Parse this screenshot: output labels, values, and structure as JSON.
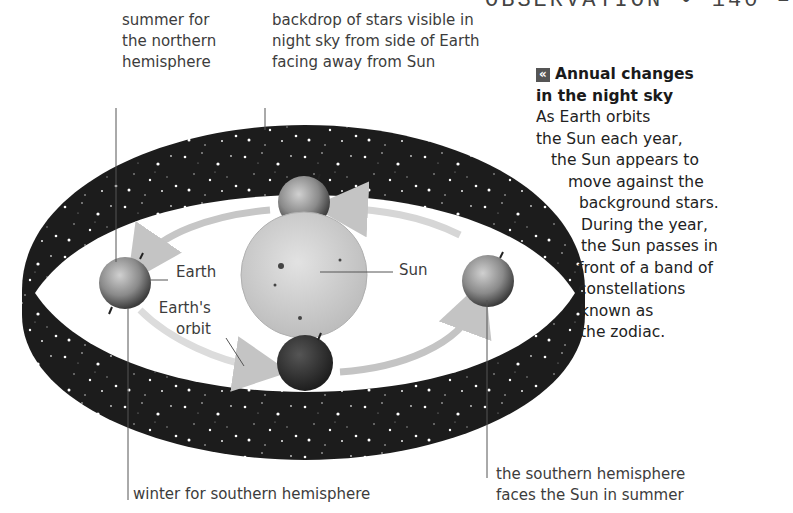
{
  "header": {
    "text": "OBSERVATION • 140 –"
  },
  "labels": {
    "summer_north": [
      "summer for",
      "the northern",
      "hemisphere"
    ],
    "backdrop": [
      "backdrop of stars visible in",
      "night sky from side of Earth",
      "facing away from Sun"
    ],
    "earth": "Earth",
    "earths_orbit": [
      "Earth's",
      "orbit"
    ],
    "sun": "Sun",
    "winter_south": "winter for southern hemisphere",
    "southern_summer": [
      "the southern hemisphere",
      "faces the Sun in summer"
    ]
  },
  "panel": {
    "icon": "«",
    "title": [
      "Annual changes",
      "in the night sky"
    ],
    "body": [
      "As Earth orbits",
      "the Sun each year,",
      "the Sun appears to",
      "move against the",
      "background stars.",
      "During the year,",
      "the Sun passes in",
      "front of a band of",
      "constellations",
      "known as",
      "the zodiac."
    ]
  },
  "colors": {
    "band": "#1c1c1c",
    "star": "#ffffff",
    "sun": "#cfcfcf",
    "orbit_arrow": "#c8c8c8",
    "earth": "#8a8a8a"
  }
}
